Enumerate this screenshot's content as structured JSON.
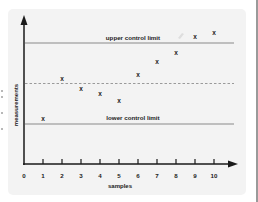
{
  "chart_data": {
    "type": "scatter",
    "title": "",
    "xlabel": "samples",
    "ylabel": "measurements",
    "x_ticks": [
      "0",
      "1",
      "2",
      "3",
      "4",
      "5",
      "6",
      "7",
      "8",
      "9",
      "10"
    ],
    "xlim": [
      0,
      11
    ],
    "ylim": [
      -4,
      14
    ],
    "y_ticks": [],
    "grid": false,
    "marker": "x",
    "series": [
      {
        "name": "measurements",
        "x": [
          1,
          2,
          3,
          4,
          5,
          6,
          7,
          8,
          9,
          10
        ],
        "y": [
          0.6,
          5.6,
          4.3,
          3.7,
          2.8,
          6.0,
          7.7,
          8.8,
          10.7,
          11.2
        ]
      }
    ],
    "reference_lines": [
      {
        "name": "upper control limit",
        "y": 10,
        "style": "solid",
        "color": "#8a8a8a"
      },
      {
        "name": "center line",
        "y": 5,
        "style": "dashed",
        "color": "#9a9a9a"
      },
      {
        "name": "lower control limit",
        "y": 0,
        "style": "solid",
        "color": "#8a8a8a"
      }
    ],
    "annotations": [
      "upper control limit",
      "lower control limit"
    ]
  },
  "labels": {
    "upper": "upper control limit",
    "lower": "lower control limit",
    "xaxis": "samples",
    "yaxis": "measurements",
    "marker_glyph": "x"
  },
  "colors": {
    "card_bg": "#f3f3f3",
    "axis": "#1a1a1a",
    "limit_line": "#8a8a8a",
    "marker": "#222222"
  }
}
